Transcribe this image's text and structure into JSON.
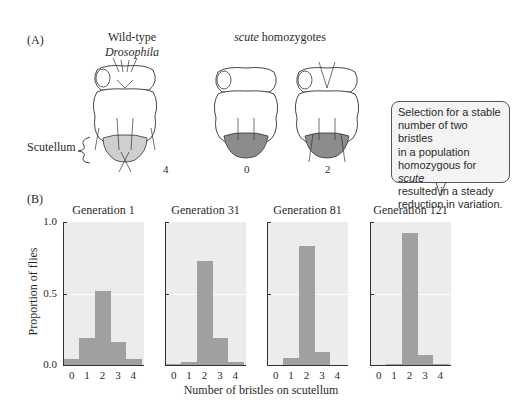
{
  "panel_a": {
    "label": "(A)",
    "wildtype_title_line1": "Wild-type",
    "wildtype_title_line2": "Drosophila",
    "scute_title_italic": "scute",
    "scute_title_rest": " homozygotes",
    "scutellum_label": "Scutellum",
    "fly_counts": [
      "4",
      "0",
      "2"
    ],
    "colors": {
      "wildtype_scutellum": "#cfcfcf",
      "scute_scutellum": "#8c8c8c",
      "outline": "#333333"
    }
  },
  "callout": {
    "line1": "Selection for a stable",
    "line2": "number of two bristles",
    "line3": "in a population",
    "line4_pre": "homozygous for ",
    "line4_italic": "scute",
    "line5": "resulted in a steady",
    "line6": "reduction in variation."
  },
  "panel_b": {
    "label": "(B)",
    "ylabel": "Proportion of flies",
    "xlabel": "Number of bristles on scutellum",
    "yticks": [
      "1.0",
      "0.5",
      "0.0"
    ],
    "xticks": [
      "0",
      "1",
      "2",
      "3",
      "4"
    ]
  },
  "chart_data": [
    {
      "type": "bar",
      "title": "Generation 1",
      "categories": [
        "0",
        "1",
        "2",
        "3",
        "4"
      ],
      "values": [
        0.04,
        0.19,
        0.52,
        0.16,
        0.04
      ],
      "xlabel": "Number of bristles on scutellum",
      "ylabel": "Proportion of flies",
      "ylim": [
        0,
        1.0
      ]
    },
    {
      "type": "bar",
      "title": "Generation 31",
      "categories": [
        "0",
        "1",
        "2",
        "3",
        "4"
      ],
      "values": [
        0.01,
        0.02,
        0.73,
        0.19,
        0.02
      ],
      "xlabel": "Number of bristles on scutellum",
      "ylabel": "Proportion of flies",
      "ylim": [
        0,
        1.0
      ]
    },
    {
      "type": "bar",
      "title": "Generation 81",
      "categories": [
        "0",
        "1",
        "2",
        "3",
        "4"
      ],
      "values": [
        0.0,
        0.05,
        0.83,
        0.09,
        0.0
      ],
      "xlabel": "Number of bristles on scutellum",
      "ylabel": "Proportion of flies",
      "ylim": [
        0,
        1.0
      ]
    },
    {
      "type": "bar",
      "title": "Generation 121",
      "categories": [
        "0",
        "1",
        "2",
        "3",
        "4"
      ],
      "values": [
        0.0,
        0.01,
        0.92,
        0.07,
        0.01
      ],
      "xlabel": "Number of bristles on scutellum",
      "ylabel": "Proportion of flies",
      "ylim": [
        0,
        1.0
      ]
    }
  ],
  "colors": {
    "bar": "#a0a0a0",
    "plot_bg": "#ececec",
    "gridline": "#ffffff"
  }
}
